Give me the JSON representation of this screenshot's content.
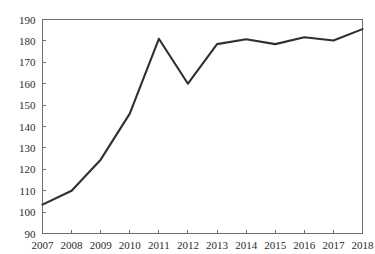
{
  "chart_data": {
    "type": "line",
    "title": "",
    "subtitle": "",
    "xlabel": "",
    "ylabel": "",
    "categories": [
      "2007",
      "2008",
      "2009",
      "2010",
      "2011",
      "2012",
      "2013",
      "2014",
      "2015",
      "2016",
      "2017",
      "2018"
    ],
    "x": [
      2007,
      2008,
      2009,
      2010,
      2011,
      2012,
      2013,
      2014,
      2015,
      2016,
      2017,
      2018
    ],
    "values": [
      103.5,
      110,
      124.5,
      146,
      181,
      160,
      178.5,
      180.8,
      178.5,
      181.7,
      180.2,
      185.5
    ],
    "series": [
      {
        "name": "series-1",
        "values": [
          103.5,
          110,
          124.5,
          146,
          181,
          160,
          178.5,
          180.8,
          178.5,
          181.7,
          180.2,
          185.5
        ],
        "color": "#2f2f33"
      }
    ],
    "xlim": [
      2007,
      2018
    ],
    "ylim": [
      90,
      190
    ],
    "ytick_labels": [
      "90",
      "100",
      "110",
      "120",
      "130",
      "140",
      "150",
      "160",
      "170",
      "180",
      "190"
    ],
    "ytick_values": [
      90,
      100,
      110,
      120,
      130,
      140,
      150,
      160,
      170,
      180,
      190
    ],
    "xtick_labels": [
      "2007",
      "2008",
      "2009",
      "2010",
      "2011",
      "2012",
      "2013",
      "2014",
      "2015",
      "2016",
      "2017",
      "2018"
    ],
    "grid": false,
    "legend": false,
    "legend_position": "none",
    "annotations": [],
    "colors": {
      "line": "#2f2f33",
      "axis": "#6f6f6f",
      "text": "#2b2b2b",
      "background": "#ffffff"
    }
  }
}
